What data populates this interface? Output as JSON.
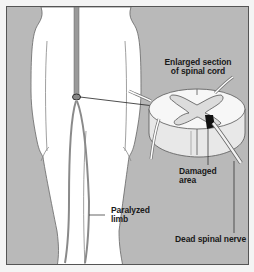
{
  "diagram": {
    "labels": {
      "enlarged_line1": "Enlarged section",
      "enlarged_line2": "of spinal cord",
      "damaged_line1": "Damaged",
      "damaged_line2": "area",
      "paralyzed_line1": "Paralyzed",
      "paralyzed_line2": "limb",
      "dead_nerve": "Dead spinal nerve"
    },
    "colors": {
      "background": "#b9b9b9",
      "body": "#ffffff",
      "spinal_cord": "#9a9a9a",
      "damaged_area": "#111111",
      "outline": "#555555"
    }
  }
}
